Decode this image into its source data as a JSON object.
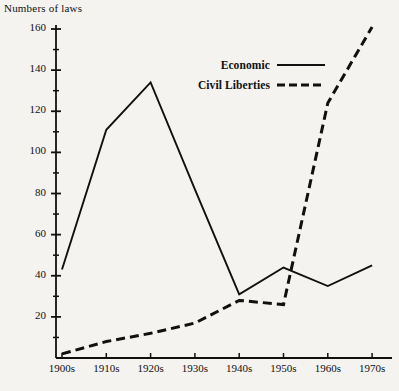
{
  "chart_data": {
    "type": "line",
    "title": "Numbers of laws",
    "xlabel": "",
    "ylabel": "Numbers of laws",
    "categories": [
      "1900s",
      "1910s",
      "1920s",
      "1930s",
      "1940s",
      "1950s",
      "1960s",
      "1970s"
    ],
    "series": [
      {
        "name": "Economic",
        "style": "solid",
        "color": "#111010",
        "values": [
          43,
          111,
          134,
          82,
          31,
          44,
          35,
          45
        ]
      },
      {
        "name": "Civil Liberties",
        "style": "dashed",
        "color": "#111010",
        "values": [
          2,
          8,
          12,
          17,
          28,
          26,
          124,
          161
        ]
      }
    ],
    "ylim": [
      0,
      160
    ],
    "xlim_labels": [
      "1900s",
      "1970s"
    ],
    "ytick_labels": [
      "20",
      "40",
      "60",
      "80",
      "100",
      "120",
      "140",
      "160"
    ],
    "ytick_values": [
      20,
      40,
      60,
      80,
      100,
      120,
      140,
      160
    ],
    "yminor_step": 10,
    "grid": false,
    "legend_position": "upper-center"
  },
  "legend": {
    "entries": [
      {
        "label": "Economic",
        "style": "solid"
      },
      {
        "label": "Civil Liberties",
        "style": "dashed"
      }
    ]
  },
  "colors": {
    "background": "#f4f3ef",
    "ink": "#111010"
  }
}
